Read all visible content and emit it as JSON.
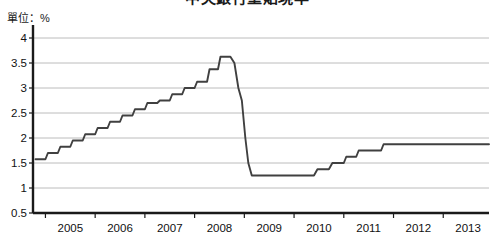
{
  "chart_data": {
    "type": "line",
    "title": "中央銀行重貼現率",
    "subtitle": "",
    "unit_label": "單位：%",
    "xlabel": "",
    "ylabel": "",
    "xlim": [
      2004.75,
      2013.92
    ],
    "ylim": [
      0.5,
      4.0
    ],
    "yticks": [
      0.5,
      1,
      1.5,
      2,
      2.5,
      3,
      3.5,
      4
    ],
    "ytick_labels": [
      "0.5",
      "1",
      "1.5",
      "2",
      "2.5",
      "3",
      "3.5",
      "4"
    ],
    "xticks": [
      2005,
      2006,
      2007,
      2008,
      2009,
      2010,
      2011,
      2012,
      2013
    ],
    "xtick_labels": [
      "2005",
      "2006",
      "2007",
      "2008",
      "2009",
      "2010",
      "2011",
      "2012",
      "2013"
    ],
    "grid": true,
    "grid_axis": "y",
    "legend": false,
    "legend_position": "none",
    "line_color": "#404040",
    "grid_color": "#bcbcbc",
    "axis_color": "#1a1a1a",
    "background_color": "#ffffff",
    "series": [
      {
        "name": "重貼現率",
        "x": [
          2004.8,
          2005.0,
          2005.05,
          2005.25,
          2005.3,
          2005.5,
          2005.55,
          2005.75,
          2005.8,
          2006.0,
          2006.05,
          2006.25,
          2006.3,
          2006.5,
          2006.55,
          2006.75,
          2006.8,
          2007.0,
          2007.05,
          2007.25,
          2007.3,
          2007.5,
          2007.55,
          2007.75,
          2007.8,
          2008.0,
          2008.05,
          2008.25,
          2008.3,
          2008.47,
          2008.52,
          2008.72,
          2008.8,
          2008.88,
          2008.95,
          2009.02,
          2009.08,
          2009.15,
          2009.2,
          2010.4,
          2010.47,
          2010.7,
          2010.77,
          2011.0,
          2011.05,
          2011.25,
          2011.3,
          2011.5,
          2011.55,
          2011.75,
          2011.8,
          2013.92
        ],
        "values": [
          1.575,
          1.575,
          1.7,
          1.7,
          1.825,
          1.825,
          1.95,
          1.95,
          2.075,
          2.075,
          2.2,
          2.2,
          2.325,
          2.325,
          2.45,
          2.45,
          2.575,
          2.575,
          2.7,
          2.7,
          2.75,
          2.75,
          2.875,
          2.875,
          3.0,
          3.0,
          3.125,
          3.125,
          3.375,
          3.375,
          3.625,
          3.625,
          3.5,
          3.0,
          2.75,
          2.0,
          1.5,
          1.25,
          1.25,
          1.25,
          1.375,
          1.375,
          1.5,
          1.5,
          1.625,
          1.625,
          1.75,
          1.75,
          1.75,
          1.75,
          1.875,
          1.875
        ]
      }
    ],
    "annotations": {
      "peak_value": 3.625,
      "peak_period": "2008",
      "trough_value": 1.25,
      "trough_period": "2009",
      "final_value": 1.875
    }
  }
}
